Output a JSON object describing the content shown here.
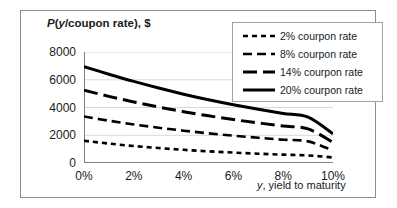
{
  "chart_data": {
    "type": "line",
    "title": "",
    "ylabel": "P(y/coupon rate), $",
    "ylabel_parts": {
      "p": "P",
      "open": "(",
      "y": "y",
      "rest": "/coupon rate), $"
    },
    "xlabel": "y, yield to maturity",
    "xlabel_parts": {
      "y": "y",
      "rest": ", yield to maturity"
    },
    "xlim": [
      0,
      10
    ],
    "ylim": [
      0,
      8000
    ],
    "grid": "horizontal",
    "legend_position": "top-right",
    "x_tick_labels": [
      "0%",
      "2%",
      "4%",
      "6%",
      "8%",
      "10%"
    ],
    "x_tick_values": [
      0,
      2,
      4,
      6,
      8,
      10
    ],
    "y_tick_labels": [
      "0",
      "2000",
      "4000",
      "6000",
      "8000"
    ],
    "y_tick_values": [
      0,
      2000,
      4000,
      6000,
      8000
    ],
    "x": [
      0,
      1,
      2,
      3,
      4,
      5,
      6,
      7,
      8,
      9,
      10
    ],
    "series": [
      {
        "name": "2% courpon rate",
        "label": "2% courpon rate",
        "coupon_rate": 2,
        "dash": "short-dash",
        "width": 2.6,
        "color": "#000000",
        "values": [
          1600,
          1400,
          1220,
          1080,
          950,
          840,
          750,
          670,
          600,
          545,
          400
        ]
      },
      {
        "name": "8% courpon rate",
        "label": "8% courpon rate",
        "coupon_rate": 8,
        "dash": "medium-dash",
        "width": 2.6,
        "color": "#000000",
        "values": [
          3350,
          3050,
          2780,
          2540,
          2330,
          2140,
          1970,
          1820,
          1680,
          1560,
          900
        ]
      },
      {
        "name": "14% courpon rate",
        "label": "14% courpon rate",
        "coupon_rate": 14,
        "dash": "long-dash",
        "width": 3.0,
        "color": "#000000",
        "values": [
          5250,
          4800,
          4400,
          4030,
          3700,
          3400,
          3130,
          2890,
          2660,
          2460,
          1480
        ]
      },
      {
        "name": "20% courpon rate",
        "label": "20% courpon rate",
        "coupon_rate": 20,
        "dash": "solid",
        "width": 3.0,
        "color": "#000000",
        "values": [
          6950,
          6400,
          5880,
          5400,
          4960,
          4560,
          4200,
          3870,
          3570,
          3300,
          2100
        ]
      }
    ],
    "colors": {
      "axis": "#7f7f7f",
      "grid": "#d9d9d9",
      "line": "#000000",
      "border": "#8c8c8c",
      "text": "#1a1a1a"
    }
  }
}
